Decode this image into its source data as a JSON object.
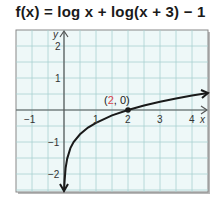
{
  "title": "f(x) = log x + log(x + 3) − 1",
  "colors": {
    "grid_bg": "#eef8f8",
    "grid_line": "#a8d0d0",
    "axis": "#555555",
    "curve": "#1a1a1a",
    "highlight": "#d9434a",
    "frame": "#777777"
  },
  "point_label": {
    "open": "(",
    "x": "2",
    "rest": ", 0)"
  },
  "axis_labels": {
    "x": "x",
    "y": "y"
  },
  "x_ticks": [
    "−1",
    "1",
    "2",
    "3",
    "4"
  ],
  "y_ticks": [
    "2",
    "1",
    "−1",
    "−2"
  ],
  "chart_data": {
    "type": "line",
    "title": "f(x) = log x + log(x + 3) − 1",
    "xlabel": "x",
    "ylabel": "y",
    "xlim": [
      -1.5,
      4.5
    ],
    "ylim": [
      -2.5,
      2.5
    ],
    "grid": true,
    "x_tick_labels": [
      -1,
      1,
      2,
      3,
      4
    ],
    "y_tick_labels": [
      -2,
      -1,
      1,
      2
    ],
    "series": [
      {
        "name": "f(x) = log x + log(x + 3) − 1",
        "x": [
          0.02,
          0.05,
          0.1,
          0.2,
          0.3,
          0.5,
          0.75,
          1,
          1.5,
          2,
          2.5,
          3,
          3.5,
          4,
          4.5
        ],
        "values": [
          -2.22,
          -1.82,
          -1.52,
          -1.19,
          -1.0,
          -0.76,
          -0.55,
          -0.4,
          -0.17,
          0.0,
          0.14,
          0.26,
          0.36,
          0.45,
          0.53
        ]
      }
    ],
    "annotations": [
      {
        "text": "(2, 0)",
        "x": 2,
        "y": 0,
        "marker": "point"
      }
    ],
    "asymptote": {
      "type": "vertical",
      "x": 0,
      "direction": "down"
    }
  }
}
